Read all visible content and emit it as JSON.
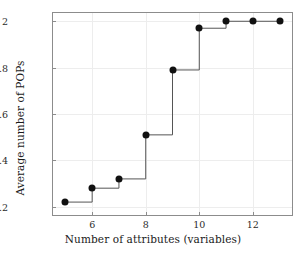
{
  "chart_data": {
    "type": "line",
    "style": "step-post",
    "title": "",
    "xlabel": "Number of attributes (variables)",
    "ylabel": "Average number of POPs",
    "x": [
      5,
      6,
      7,
      8,
      9,
      10,
      11,
      12,
      13
    ],
    "values": [
      1.22,
      1.28,
      1.32,
      1.51,
      1.79,
      1.97,
      2.0,
      2.0,
      2.0
    ],
    "series": [
      {
        "name": "Average number of POPs",
        "values": [
          1.22,
          1.28,
          1.32,
          1.51,
          1.79,
          1.97,
          2.0,
          2.0,
          2.0
        ]
      }
    ],
    "xlim": [
      4.5,
      13.5
    ],
    "ylim": [
      1.16,
      2.04
    ],
    "xticks": [
      6,
      8,
      10,
      12
    ],
    "xtick_labels": [
      "6",
      "8",
      "10",
      "12"
    ],
    "yticks": [
      1.2,
      1.4,
      1.6,
      1.8,
      2.0
    ],
    "ytick_labels": [
      "1.2",
      "1.4",
      "1.6",
      "1.8",
      "2"
    ],
    "grid": true,
    "legend": false,
    "marker": "filled-circle",
    "marker_color": "#111111",
    "line_color": "#555555",
    "grid_color": "#ededed",
    "frame_color": "#8c8c8c",
    "background": "#ffffff"
  }
}
